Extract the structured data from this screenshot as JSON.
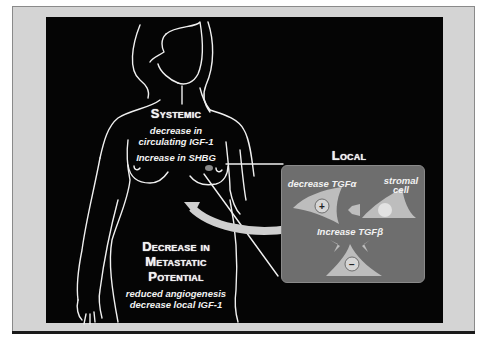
{
  "figure": {
    "systemic": {
      "title": "Systemic",
      "lines": [
        "decrease in",
        "circulating IGF-1",
        "Increase in SHBG"
      ]
    },
    "local": {
      "title": "Local",
      "decrease_label": "decrease TGFα",
      "stromal_label_1": "stromal",
      "stromal_label_2": "cell",
      "increase_label": "Increase TGFβ",
      "plus_symbol": "+",
      "minus_symbol": "−"
    },
    "outcome": {
      "title_lines": [
        "Decrease in",
        "Metastatic",
        "Potential"
      ],
      "lines": [
        "reduced angiogenesis",
        "decrease local IGF-1"
      ]
    },
    "colors": {
      "background": "#050505",
      "frame": "#d4d4d4",
      "local_box": "#6e6e6e",
      "cell_fill": "#bdbdbd",
      "text": "#f2f2f2"
    }
  }
}
